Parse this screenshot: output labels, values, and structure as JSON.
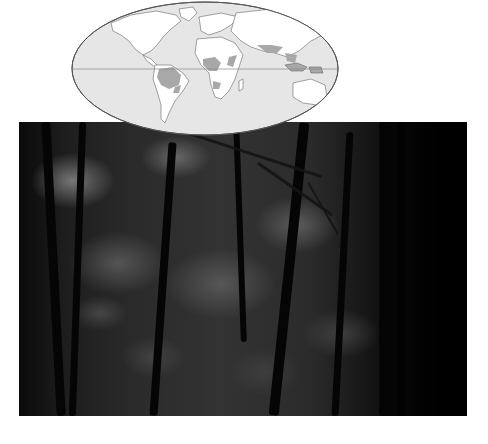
{
  "figure": {
    "map": {
      "projection": "elliptical (Mollweide-style) world map",
      "ocean_color": "#e6e6e6",
      "land_color": "#ffffff",
      "rainforest_color": "#a8a8a8",
      "outline_color": "#555555",
      "equator_line": true,
      "shaded_regions": [
        "Amazon Basin (South America)",
        "Central Africa / Congo Basin",
        "East Africa coast",
        "Madagascar",
        "South & Southeast Asia",
        "Indonesia / New Guinea"
      ]
    },
    "photo": {
      "subject": "Dense tropical rainforest interior with tree trunks and hanging vines",
      "tone": "black-and-white"
    }
  }
}
